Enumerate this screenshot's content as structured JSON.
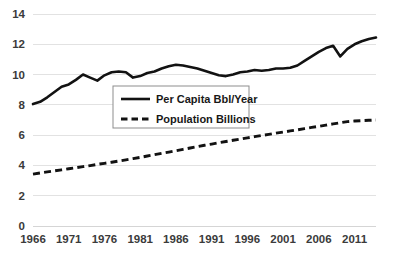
{
  "chart_data": {
    "type": "line",
    "title": "",
    "xlabel": "",
    "ylabel": "",
    "xlim": [
      1966,
      2014
    ],
    "ylim": [
      0,
      14
    ],
    "grid": true,
    "legend_position": "center-left",
    "xticks": [
      "1966",
      "1971",
      "1976",
      "1981",
      "1986",
      "1991",
      "1996",
      "2001",
      "2006",
      "2011"
    ],
    "yticks": [
      "0",
      "2",
      "4",
      "6",
      "8",
      "10",
      "12",
      "14"
    ],
    "x": [
      1966,
      1967,
      1968,
      1969,
      1970,
      1971,
      1972,
      1973,
      1974,
      1975,
      1976,
      1977,
      1978,
      1979,
      1980,
      1981,
      1982,
      1983,
      1984,
      1985,
      1986,
      1987,
      1988,
      1989,
      1990,
      1991,
      1992,
      1993,
      1994,
      1995,
      1996,
      1997,
      1998,
      1999,
      2000,
      2001,
      2002,
      2003,
      2004,
      2005,
      2006,
      2007,
      2008,
      2009,
      2010,
      2011,
      2012,
      2013,
      2014
    ],
    "series": [
      {
        "name": "Per Capita Bbl/Year",
        "style": "solid",
        "color": "#121212",
        "values": [
          8.05,
          8.2,
          8.5,
          8.85,
          9.2,
          9.35,
          9.65,
          10.0,
          9.8,
          9.6,
          9.95,
          10.15,
          10.2,
          10.15,
          9.8,
          9.9,
          10.1,
          10.2,
          10.4,
          10.55,
          10.65,
          10.6,
          10.5,
          10.4,
          10.25,
          10.1,
          9.95,
          9.9,
          10.0,
          10.15,
          10.2,
          10.3,
          10.25,
          10.3,
          10.4,
          10.4,
          10.45,
          10.6,
          10.9,
          11.2,
          11.5,
          11.75,
          11.9,
          11.2,
          11.7,
          12.0,
          12.2,
          12.35,
          12.45
        ]
      },
      {
        "name": "Population Billions",
        "style": "dashed",
        "color": "#121212",
        "values": [
          3.43,
          3.5,
          3.57,
          3.64,
          3.71,
          3.78,
          3.85,
          3.92,
          3.99,
          4.07,
          4.14,
          4.21,
          4.29,
          4.37,
          4.45,
          4.53,
          4.62,
          4.71,
          4.8,
          4.88,
          4.97,
          5.06,
          5.15,
          5.24,
          5.33,
          5.41,
          5.5,
          5.58,
          5.66,
          5.74,
          5.82,
          5.9,
          5.98,
          6.05,
          6.13,
          6.2,
          6.28,
          6.35,
          6.43,
          6.51,
          6.58,
          6.66,
          6.74,
          6.82,
          6.89,
          6.93,
          6.96,
          6.98,
          7.0
        ]
      }
    ],
    "legend": [
      {
        "label": "Per Capita Bbl/Year",
        "style": "solid"
      },
      {
        "label": "Population Billions",
        "style": "dashed"
      }
    ]
  }
}
